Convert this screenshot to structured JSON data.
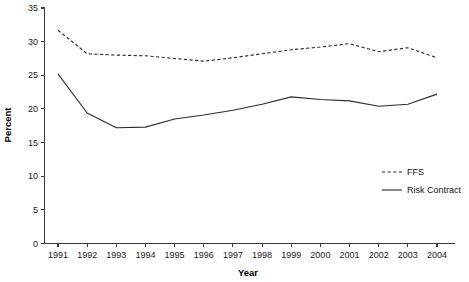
{
  "chart_data": {
    "type": "line",
    "title": "",
    "xlabel": "Year",
    "ylabel": "Percent",
    "xlim": [
      1991,
      2004
    ],
    "ylim": [
      0,
      35
    ],
    "ytick_step": 5,
    "grid": false,
    "legend_position": "center-right",
    "categories": [
      "1991",
      "1992",
      "1993",
      "1994",
      "1995",
      "1996",
      "1997",
      "1998",
      "1999",
      "2000",
      "2001",
      "2002",
      "2003",
      "2004"
    ],
    "x": [
      1991,
      1992,
      1993,
      1994,
      1995,
      1996,
      1997,
      1998,
      1999,
      2000,
      2001,
      2002,
      2003,
      2004
    ],
    "yticks": [
      0,
      5,
      10,
      15,
      20,
      25,
      30,
      35
    ],
    "ytick_labels": [
      "0",
      "5",
      "10",
      "15",
      "20",
      "25",
      "30",
      "35"
    ],
    "series": [
      {
        "name": "FFS",
        "style": "dashed",
        "color": "#2e2e2e",
        "values": [
          31.7,
          28.2,
          28.0,
          27.9,
          27.5,
          27.1,
          27.6,
          28.2,
          28.8,
          29.2,
          29.7,
          28.5,
          29.1,
          27.6
        ]
      },
      {
        "name": "Risk Contract",
        "style": "solid",
        "color": "#2e2e2e",
        "values": [
          25.2,
          19.4,
          17.2,
          17.3,
          18.5,
          19.1,
          19.8,
          20.7,
          21.8,
          21.4,
          21.2,
          20.4,
          20.7,
          22.2
        ]
      }
    ],
    "legend": [
      {
        "label": "FFS",
        "style": "dashed"
      },
      {
        "label": "Risk Contract",
        "style": "solid"
      }
    ]
  }
}
